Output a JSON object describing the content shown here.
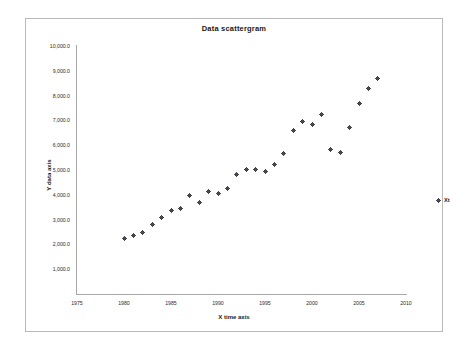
{
  "chart_data": {
    "type": "scatter",
    "title": "Data scattergram",
    "xlabel": "X time axis",
    "ylabel": "Y data axis",
    "xlim": [
      1975,
      2010
    ],
    "ylim": [
      0,
      10000
    ],
    "xticks": [
      1975,
      1980,
      1985,
      1990,
      1995,
      2000,
      2005,
      2010
    ],
    "xtick_labels": [
      "1975",
      "1980",
      "1985",
      "1990",
      "1995",
      "2000",
      "2005",
      "2010"
    ],
    "yticks": [
      1000,
      2000,
      3000,
      4000,
      5000,
      6000,
      7000,
      8000,
      9000,
      10000
    ],
    "ytick_labels": [
      "1,000.0",
      "2,000.0",
      "3,000.0",
      "4,000.0",
      "5,000.0",
      "6,000.0",
      "7,000.0",
      "8,000.0",
      "9,000.0",
      "10,000.0"
    ],
    "grid": false,
    "legend_position": "right",
    "series": [
      {
        "name": "Xt",
        "marker": "plus",
        "color": "#3a3a40",
        "x": [
          1980,
          1981,
          1982,
          1983,
          1984,
          1985,
          1986,
          1987,
          1988,
          1989,
          1990,
          1991,
          1992,
          1993,
          1994,
          1995,
          1996,
          1997,
          1998,
          1999,
          2000,
          2001,
          2002,
          2003,
          2004,
          2005,
          2006,
          2007
        ],
        "y": [
          2250,
          2350,
          2500,
          2800,
          3100,
          3350,
          3450,
          3980,
          3700,
          4120,
          4050,
          4270,
          4830,
          5030,
          5020,
          4950,
          5210,
          5680,
          6600,
          6950,
          6830,
          7250,
          5820,
          5720,
          6720,
          7680,
          8280,
          8690
        ]
      }
    ]
  },
  "legend": {
    "entries": [
      {
        "label": "Xt",
        "marker": "plus-marker"
      }
    ]
  },
  "colors": {
    "marker": "#3a3a40",
    "axis": "#a8a8a8",
    "frame": "#b9b9b9",
    "text": "#1a1a1a"
  }
}
